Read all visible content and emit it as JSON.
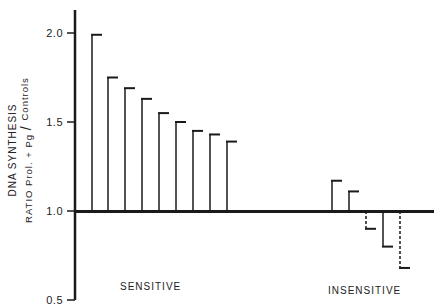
{
  "chart_data": {
    "type": "bar",
    "title": "",
    "xlabel": "",
    "ylabel": "DNA SYNTHESIS RATIO Prol. + Pg / Controls",
    "ylabel_line1": "DNA SYNTHESIS",
    "ylabel_line2": "RATIO  Prol. + Pg",
    "ylabel_line2b": "Controls",
    "ylim": [
      0.5,
      2.1
    ],
    "baseline": 1.0,
    "yticks": [
      "0.5",
      "1.0",
      "1.5",
      "2.0"
    ],
    "ytick_values": [
      0.5,
      1.0,
      1.5,
      2.0
    ],
    "grid": false,
    "groups": [
      {
        "name": "SENSITIVE",
        "values": [
          1.99,
          1.75,
          1.69,
          1.63,
          1.55,
          1.5,
          1.45,
          1.43,
          1.39
        ],
        "styles": [
          "solid",
          "solid",
          "solid",
          "solid",
          "solid",
          "solid",
          "solid",
          "solid",
          "solid"
        ]
      },
      {
        "name": "INSENSITIVE",
        "values": [
          1.17,
          1.11,
          0.9,
          0.8,
          0.68
        ],
        "styles": [
          "solid",
          "solid",
          "dashed",
          "solid",
          "dashed"
        ]
      }
    ]
  }
}
